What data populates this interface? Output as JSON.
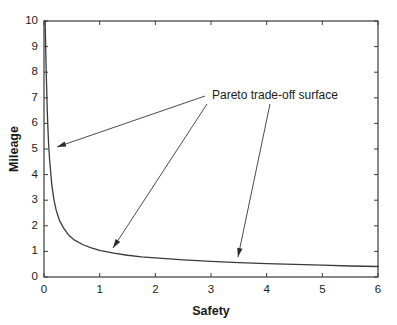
{
  "chart_data": {
    "type": "line",
    "title": "",
    "xlabel": "Safety",
    "ylabel": "Mileage",
    "xlim": [
      0,
      6
    ],
    "ylim": [
      0,
      10
    ],
    "xticks": [
      "0",
      "1",
      "2",
      "3",
      "4",
      "5",
      "6"
    ],
    "yticks": [
      "0",
      "1",
      "2",
      "3",
      "4",
      "5",
      "6",
      "7",
      "8",
      "9",
      "10"
    ],
    "grid": false,
    "legend": null,
    "series": [
      {
        "name": "Pareto trade-off surface",
        "x": [
          0.02,
          0.04,
          0.06,
          0.08,
          0.1,
          0.14,
          0.18,
          0.22,
          0.28,
          0.35,
          0.45,
          0.55,
          0.7,
          0.85,
          1.0,
          1.25,
          1.5,
          1.75,
          2.0,
          2.5,
          3.0,
          3.5,
          4.0,
          4.5,
          5.0,
          5.5,
          6.0
        ],
        "y": [
          10.0,
          8.0,
          6.4,
          5.3,
          4.6,
          3.6,
          3.0,
          2.6,
          2.2,
          1.92,
          1.62,
          1.44,
          1.26,
          1.14,
          1.04,
          0.93,
          0.85,
          0.79,
          0.75,
          0.67,
          0.61,
          0.56,
          0.52,
          0.49,
          0.46,
          0.43,
          0.41
        ]
      }
    ],
    "annotations": [
      {
        "label": "Pareto trade-off surface",
        "text_x": 212,
        "text_y": 95,
        "leaders": [
          {
            "from_x": 205,
            "from_y": 96,
            "to_x": 57,
            "to_y": 147
          },
          {
            "from_x": 207,
            "from_y": 104,
            "to_x": 113,
            "to_y": 248
          },
          {
            "from_x": 270,
            "from_y": 104,
            "to_x": 238,
            "to_y": 257
          }
        ]
      }
    ],
    "colors": {
      "background": "#ffffff",
      "axis": "#3a3a3a",
      "curve": "#3a3a3a",
      "text": "#1a1a1a",
      "annotation_line": "#4a4a4a"
    }
  },
  "axes": {
    "x_title": "Safety",
    "y_title": "Mileage"
  }
}
